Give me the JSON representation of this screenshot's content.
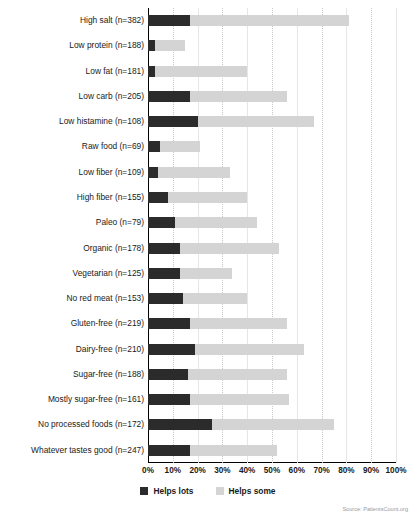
{
  "chart_data": {
    "type": "bar",
    "subtype": "stacked-horizontal-bar",
    "title": "",
    "xlabel": "",
    "ylabel": "",
    "xlim": [
      0,
      100
    ],
    "xtick_labels": [
      "0%",
      "10%",
      "20%",
      "30%",
      "40%",
      "50%",
      "60%",
      "70%",
      "80%",
      "90%",
      "100%"
    ],
    "xtick_values": [
      0,
      10,
      20,
      30,
      40,
      50,
      60,
      70,
      80,
      90,
      100
    ],
    "grid": true,
    "legend_position": "bottom-center",
    "categories": [
      "High salt (n=382)",
      "Low protein (n=188)",
      "Low fat (n=181)",
      "Low carb (n=205)",
      "Low histamine (n=108)",
      "Raw food (n=69)",
      "Low fiber (n=109)",
      "High fiber (n=155)",
      "Paleo (n=79)",
      "Organic (n=178)",
      "Vegetarian (n=125)",
      "No red meat (n=153)",
      "Gluten-free (n=219)",
      "Dairy-free (n=210)",
      "Sugar-free (n=188)",
      "Mostly sugar-free (n=161)",
      "No processed foods (n=172)",
      "Whatever tastes good (n=247)"
    ],
    "series": [
      {
        "name": "Helps lots",
        "color": "#2b2b2b",
        "values": [
          17,
          3,
          3,
          17,
          20,
          5,
          4,
          8,
          11,
          13,
          13,
          14,
          17,
          19,
          16,
          17,
          26,
          17
        ]
      },
      {
        "name": "Helps some",
        "color": "#d4d4d4",
        "values": [
          64,
          12,
          37,
          39,
          47,
          16,
          29,
          32,
          33,
          40,
          21,
          26,
          39,
          44,
          40,
          40,
          49,
          35
        ]
      }
    ],
    "totals": [
      81,
      15,
      40,
      56,
      67,
      21,
      33,
      40,
      44,
      53,
      34,
      40,
      56,
      63,
      56,
      57,
      75,
      52
    ]
  },
  "legend": {
    "items": [
      {
        "label": "Helps lots",
        "color": "#2b2b2b",
        "swatch": "legend-swatch-dark"
      },
      {
        "label": "Helps some",
        "color": "#d4d4d4",
        "swatch": "legend-swatch-light"
      }
    ]
  },
  "source": {
    "text": "Source: PatientsCount.org"
  }
}
